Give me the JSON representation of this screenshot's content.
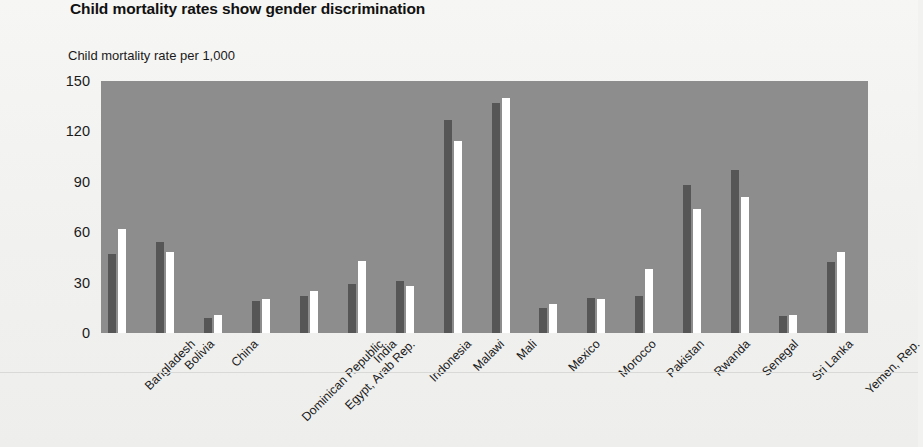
{
  "title": "Child mortality rates show gender discrimination",
  "axis_caption": "Child mortality rate per 1,000",
  "colors": {
    "plot_background": "#8d8d8d",
    "page_background": "#f2f2f0",
    "male_bar": "#565656",
    "female_bar": "#ffffff",
    "text": "#1a1a1a"
  },
  "chart_data": {
    "type": "bar",
    "title": "Child mortality rates show gender discrimination",
    "xlabel": "",
    "ylabel": "Child mortality rate per 1,000",
    "ylim": [
      0,
      150
    ],
    "yticks": [
      0,
      30,
      60,
      90,
      120,
      150
    ],
    "grid": false,
    "legend": "none",
    "categories": [
      "Bangladesh",
      "Bolivia",
      "China",
      "Dominican Republic",
      "Egypt, Arab Rep.",
      "India",
      "Indonesia",
      "Malawi",
      "Mali",
      "Mexico",
      "Morocco",
      "Pakistan",
      "Rwanda",
      "Senegal",
      "Sri Lanka",
      "Yemen, Rep."
    ],
    "series": [
      {
        "name": "male",
        "values": [
          47,
          54,
          9,
          19,
          22,
          29,
          31,
          127,
          137,
          15,
          21,
          22,
          88,
          97,
          10,
          42
        ]
      },
      {
        "name": "female",
        "values": [
          62,
          48,
          11,
          20,
          25,
          43,
          28,
          114,
          140,
          17,
          20,
          38,
          74,
          81,
          11,
          48
        ]
      }
    ]
  }
}
